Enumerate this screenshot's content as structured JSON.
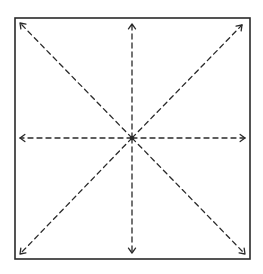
{
  "diagram": {
    "colors": {
      "stroke": "#2a2a2a",
      "background": "#ffffff"
    },
    "frame": {
      "x1": 15,
      "y1": 18,
      "x2": 250,
      "y2": 259
    },
    "center": {
      "x": 132,
      "y": 138
    },
    "arrows": [
      {
        "name": "arrow-up",
        "x": 132,
        "y": 24
      },
      {
        "name": "arrow-down",
        "x": 132,
        "y": 253
      },
      {
        "name": "arrow-left",
        "x": 20,
        "y": 138
      },
      {
        "name": "arrow-right",
        "x": 245,
        "y": 138
      },
      {
        "name": "arrow-up-left",
        "x": 20,
        "y": 23
      },
      {
        "name": "arrow-up-right",
        "x": 242,
        "y": 25
      },
      {
        "name": "arrow-down-left",
        "x": 20,
        "y": 254
      },
      {
        "name": "arrow-down-right",
        "x": 245,
        "y": 254
      }
    ]
  }
}
